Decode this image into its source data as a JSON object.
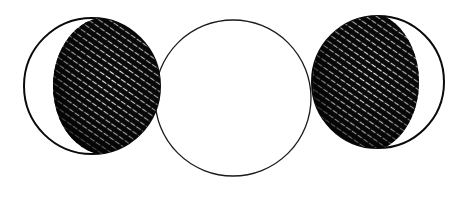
{
  "illustration": {
    "subject": "triple moon symbol",
    "style": "pen and ink cross-hatched drawing",
    "background": "#ffffff",
    "ink": "#0a0a0a",
    "figures": [
      {
        "name": "waxing-crescent-moon",
        "outer": {
          "cx": 92,
          "cy": 86,
          "r": 68
        },
        "shadow": {
          "cx": 107,
          "cy": 86,
          "rx": 54,
          "ry": 69
        }
      },
      {
        "name": "full-moon",
        "outer": {
          "cx": 233,
          "cy": 98,
          "r": 78
        }
      },
      {
        "name": "waning-crescent-moon",
        "outer": {
          "cx": 378,
          "cy": 82,
          "r": 66
        },
        "shadow": {
          "cx": 366,
          "cy": 82,
          "rx": 53,
          "ry": 70
        }
      }
    ]
  }
}
